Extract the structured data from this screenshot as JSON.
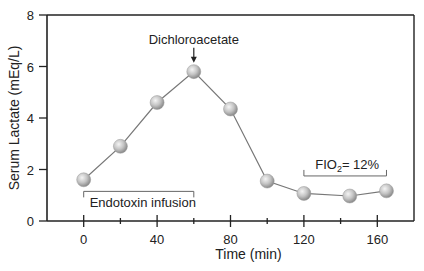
{
  "chart_data": {
    "type": "line",
    "title": "",
    "xlabel": "Time (min)",
    "ylabel": "Serum Lactate (mEq/L)",
    "xlim": [
      -20,
      180
    ],
    "ylim": [
      0,
      8
    ],
    "xticks": [
      0,
      20,
      40,
      60,
      80,
      100,
      120,
      140,
      160
    ],
    "xtick_labels": [
      "0",
      "",
      "40",
      "",
      "80",
      "",
      "120",
      "",
      "160"
    ],
    "yticks": [
      0,
      2,
      4,
      6,
      8
    ],
    "ytick_labels": [
      "0",
      "2",
      "4",
      "6",
      "8"
    ],
    "grid": false,
    "series": [
      {
        "name": "Serum Lactate",
        "x": [
          0,
          20,
          40,
          60,
          80,
          100,
          120,
          145,
          165
        ],
        "y": [
          1.6,
          2.9,
          4.6,
          5.8,
          4.35,
          1.55,
          1.07,
          0.97,
          1.17
        ]
      }
    ],
    "annotations": [
      {
        "text": "Dichloroacetate",
        "type": "arrow",
        "x": 60
      },
      {
        "text": "Endotoxin infusion",
        "type": "bracket",
        "x_start": 0,
        "x_end": 60,
        "y": 1.15,
        "label_position": "below"
      },
      {
        "text_main": "FIO",
        "text_sub": "2",
        "text_rest": "= 12%",
        "type": "bracket",
        "x_start": 120,
        "x_end": 165,
        "y": 1.75,
        "label_position": "above"
      }
    ]
  }
}
